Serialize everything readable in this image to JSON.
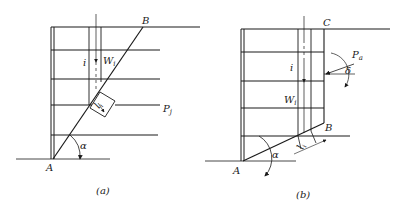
{
  "figure": {
    "panel_a": {
      "caption": "(a)",
      "labels": {
        "A": "A",
        "B": "B",
        "i": "i",
        "W": "W",
        "W_sub": "i",
        "P": "P",
        "P_sub": "j",
        "l": "l",
        "l_sub": "i",
        "alpha": "α"
      }
    },
    "panel_b": {
      "caption": "(b)",
      "labels": {
        "A": "A",
        "B": "B",
        "C": "C",
        "i": "i",
        "W": "W",
        "W_sub": "i",
        "P": "P",
        "P_sub": "a",
        "delta": "δ",
        "l": "l",
        "l_sub": "i",
        "alpha": "α"
      }
    },
    "colors": {
      "line": "#1a1a1a",
      "background": "#ffffff"
    }
  }
}
